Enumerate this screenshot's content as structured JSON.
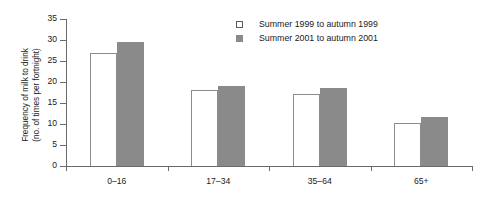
{
  "chart_data": {
    "type": "bar",
    "title": "",
    "xlabel": "",
    "ylabel": "Frequency of milk to drink (no. of times per fortnight)",
    "ylabel_lines": [
      "Frequency of milk to drink",
      "(no. of times per fortnight)"
    ],
    "categories": [
      "0–16",
      "17–34",
      "35–64",
      "65+"
    ],
    "series": [
      {
        "name": "Summer 1999 to autumn 1999",
        "color": "#ffffff",
        "border": "#8c8c8c",
        "values": [
          27.0,
          18.1,
          17.1,
          10.2
        ]
      },
      {
        "name": "Summer 2001 to autumn 2001",
        "color": "#8a8a8a",
        "border": "#8a8a8a",
        "values": [
          29.6,
          19.0,
          18.6,
          11.7
        ]
      }
    ],
    "ylim": [
      0,
      35
    ],
    "yticks": [
      0,
      5,
      10,
      15,
      20,
      25,
      30,
      35
    ],
    "ytick_labels": [
      "0",
      "5",
      "10",
      "15",
      "20",
      "25",
      "30",
      "35"
    ],
    "grid": false,
    "legend_position": "upper-center",
    "axis_color": "#6b6b6b",
    "text_color": "#1a1a1a",
    "background": "#ffffff"
  }
}
